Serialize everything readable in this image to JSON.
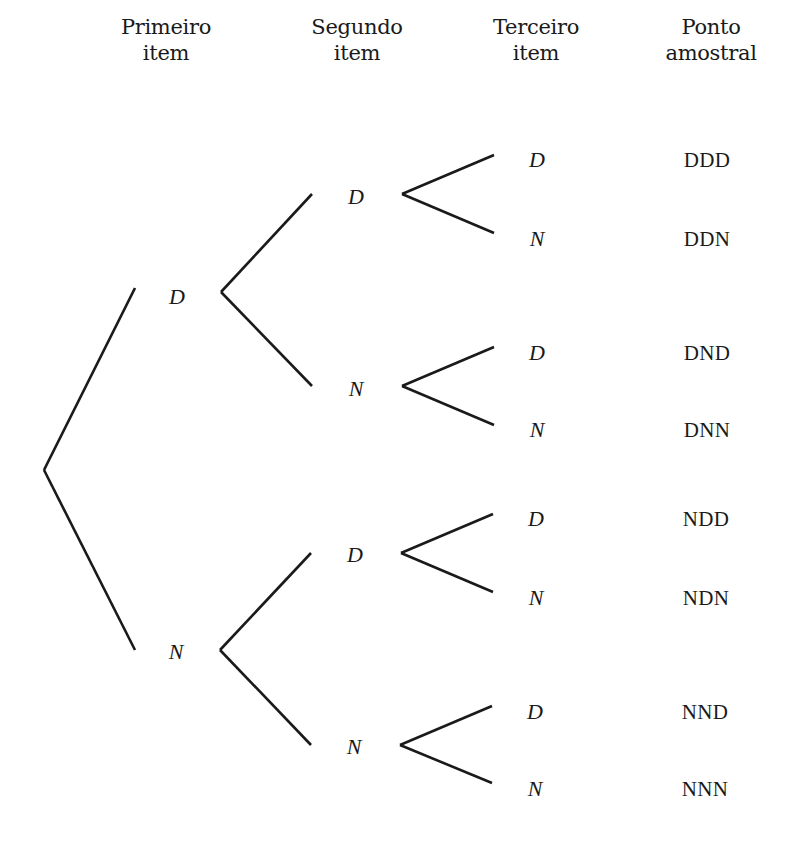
{
  "diagram": {
    "type": "probability_tree",
    "line_color": "#1a1a1a",
    "background": "#ffffff",
    "headers": [
      {
        "line1": "Primeiro",
        "line2": "item",
        "x": 166,
        "y": 14
      },
      {
        "line1": "Segundo",
        "line2": "item",
        "x": 357,
        "y": 14
      },
      {
        "line1": "Terceiro",
        "line2": "item",
        "x": 536,
        "y": 14
      },
      {
        "line1": "Ponto",
        "line2": "amostral",
        "x": 711,
        "y": 14
      }
    ],
    "edges": [
      {
        "x1": 44,
        "y1": 470,
        "x2": 135,
        "y2": 288
      },
      {
        "x1": 44,
        "y1": 470,
        "x2": 135,
        "y2": 650
      },
      {
        "x1": 221,
        "y1": 292,
        "x2": 312,
        "y2": 194
      },
      {
        "x1": 221,
        "y1": 292,
        "x2": 312,
        "y2": 386
      },
      {
        "x1": 220,
        "y1": 650,
        "x2": 311,
        "y2": 553
      },
      {
        "x1": 220,
        "y1": 650,
        "x2": 311,
        "y2": 745
      },
      {
        "x1": 402,
        "y1": 194,
        "x2": 494,
        "y2": 155
      },
      {
        "x1": 402,
        "y1": 194,
        "x2": 494,
        "y2": 233
      },
      {
        "x1": 402,
        "y1": 386,
        "x2": 494,
        "y2": 347
      },
      {
        "x1": 402,
        "y1": 386,
        "x2": 494,
        "y2": 425
      },
      {
        "x1": 401,
        "y1": 553,
        "x2": 493,
        "y2": 514
      },
      {
        "x1": 401,
        "y1": 553,
        "x2": 493,
        "y2": 592
      },
      {
        "x1": 400,
        "y1": 745,
        "x2": 492,
        "y2": 706
      },
      {
        "x1": 400,
        "y1": 745,
        "x2": 492,
        "y2": 783
      }
    ],
    "level1_nodes": [
      {
        "label": "D",
        "x": 177,
        "y": 297
      },
      {
        "label": "N",
        "x": 176,
        "y": 652
      }
    ],
    "level2_nodes": [
      {
        "label": "D",
        "x": 356,
        "y": 197
      },
      {
        "label": "N",
        "x": 356,
        "y": 389
      },
      {
        "label": "D",
        "x": 355,
        "y": 555
      },
      {
        "label": "N",
        "x": 354,
        "y": 747
      }
    ],
    "level3_nodes": [
      {
        "label": "D",
        "x": 537,
        "y": 160
      },
      {
        "label": "N",
        "x": 537,
        "y": 239
      },
      {
        "label": "D",
        "x": 537,
        "y": 353
      },
      {
        "label": "N",
        "x": 537,
        "y": 430
      },
      {
        "label": "D",
        "x": 536,
        "y": 519
      },
      {
        "label": "N",
        "x": 536,
        "y": 598
      },
      {
        "label": "D",
        "x": 535,
        "y": 712
      },
      {
        "label": "N",
        "x": 535,
        "y": 789
      }
    ],
    "sample_points": [
      {
        "label": "DDD",
        "x": 707,
        "y": 160
      },
      {
        "label": "DDN",
        "x": 707,
        "y": 239
      },
      {
        "label": "DND",
        "x": 707,
        "y": 353
      },
      {
        "label": "DNN",
        "x": 707,
        "y": 430
      },
      {
        "label": "NDD",
        "x": 706,
        "y": 519
      },
      {
        "label": "NDN",
        "x": 706,
        "y": 598
      },
      {
        "label": "NND",
        "x": 705,
        "y": 712
      },
      {
        "label": "NNN",
        "x": 705,
        "y": 789
      }
    ]
  }
}
